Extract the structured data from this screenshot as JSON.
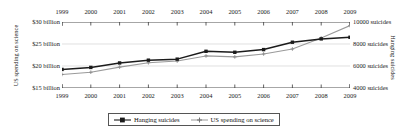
{
  "chart_data": {
    "type": "line",
    "title": "",
    "x": [
      1999,
      2000,
      2001,
      2002,
      2003,
      2004,
      2005,
      2006,
      2007,
      2008,
      2009
    ],
    "xlabel": "",
    "grid": true,
    "legend_position": "bottom",
    "axes": {
      "left": {
        "label": "US spending on science",
        "ticks": [
          {
            "value": 30,
            "text": "$30 billion"
          },
          {
            "value": 25,
            "text": "$25 billion"
          },
          {
            "value": 20,
            "text": "$20 billion"
          },
          {
            "value": 15,
            "text": "$15 billion"
          }
        ],
        "ylim": [
          15,
          30
        ]
      },
      "right": {
        "label": "Hanging suicides",
        "ticks": [
          {
            "value": 10000,
            "text": "10000 suicides"
          },
          {
            "value": 8000,
            "text": "8000 suicides"
          },
          {
            "value": 6000,
            "text": "6000 suicides"
          },
          {
            "value": 4000,
            "text": "4000 suicides"
          }
        ],
        "ylim": [
          4000,
          10000
        ]
      }
    },
    "xtick_labels": [
      "1999",
      "2000",
      "2001",
      "2002",
      "2003",
      "2004",
      "2005",
      "2006",
      "2007",
      "2008",
      "2009"
    ],
    "series": [
      {
        "name": "Hanging suicides",
        "axis": "right",
        "unit": "suicides",
        "color": "#1b1b1b",
        "marker": "filled-square",
        "values": [
          5688,
          5871,
          6277,
          6529,
          6623,
          7336,
          7248,
          7491,
          8161,
          8465,
          8612
        ]
      },
      {
        "name": "US spending on science",
        "axis": "left",
        "unit": "billion USD",
        "color": "#9a9a9a",
        "marker": "small-cross",
        "values": [
          18.08,
          18.59,
          19.75,
          20.73,
          21.12,
          22.29,
          22.07,
          22.74,
          23.87,
          26.38,
          29.19
        ]
      }
    ]
  },
  "legend": {
    "items": [
      {
        "label": "Hanging suicides"
      },
      {
        "label": "US spending on science"
      }
    ]
  }
}
